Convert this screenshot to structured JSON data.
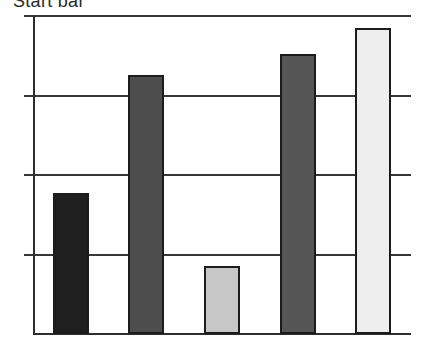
{
  "title": "Start bar",
  "chart_data": {
    "type": "bar",
    "title": "Start bar",
    "title_note": "title text is clipped at the top edge of the image",
    "categories": [
      "",
      "",
      "",
      "",
      ""
    ],
    "values": [
      1.77,
      3.26,
      0.85,
      3.52,
      3.85
    ],
    "ylim": [
      0,
      4
    ],
    "num_divisions": 4,
    "axis_tick_labels": "none visible",
    "legend": "none",
    "xlabel": "",
    "ylabel": "",
    "grid": "horizontal gridlines with short tick overhang left of y-axis",
    "bar_colors": [
      "#1f1f1f",
      "#4d4d4d",
      "#c7c7c7",
      "#565656",
      "#eeeeee"
    ],
    "bar_border_color": "#1c1c1c",
    "line_color": "#383838",
    "axis_color": "#2e2e2e",
    "title_color": "#2a2a2a",
    "background": "#fefefe"
  }
}
